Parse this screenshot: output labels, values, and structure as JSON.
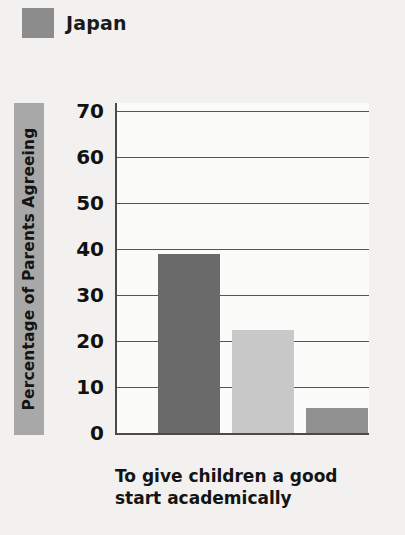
{
  "legend": {
    "items": [
      {
        "label": "Japan",
        "color": "#8c8c8c"
      }
    ]
  },
  "axes": {
    "y_title": "Percentage of Parents Agreeing",
    "x_caption_line1": "To give children a good",
    "x_caption_line2": "start academically",
    "x_caption": "To give children a good start academically"
  },
  "chart_data": {
    "type": "bar",
    "title": "",
    "subtitle": "",
    "xlabel": "To give children a good start academically",
    "ylabel": "Percentage of Parents Agreeing",
    "ylim": [
      0,
      70
    ],
    "yticks": [
      0,
      10,
      20,
      30,
      40,
      50,
      60,
      70
    ],
    "ytick_labels": [
      "0",
      "10",
      "20",
      "30",
      "40",
      "50",
      "60",
      "70"
    ],
    "grid": true,
    "grid_axis": "y",
    "legend_position": "top-left",
    "legend_entries": [
      "Japan"
    ],
    "categories": [
      "To give children a good start academically"
    ],
    "series": [
      {
        "name": "Japan",
        "values": [
          39
        ],
        "color": "#6a6a6a"
      },
      {
        "name": "Series 2",
        "values": [
          22.5
        ],
        "color": "#c8c8c8"
      },
      {
        "name": "Series 3",
        "values": [
          5.5
        ],
        "color": "#909090"
      }
    ],
    "bars": [
      {
        "name": "Japan",
        "value": 39,
        "color": "#6a6a6a"
      },
      {
        "name": "Series 2",
        "value": 22.5,
        "color": "#c8c8c8"
      },
      {
        "name": "Series 3",
        "value": 5.5,
        "color": "#909090"
      }
    ]
  }
}
